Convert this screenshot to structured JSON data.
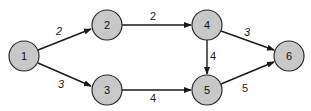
{
  "graph": {
    "type": "directed-weighted",
    "nodes": [
      {
        "id": "1",
        "label": "1",
        "x": 24,
        "y": 56
      },
      {
        "id": "2",
        "label": "2",
        "x": 107,
        "y": 25
      },
      {
        "id": "3",
        "label": "3",
        "x": 107,
        "y": 90
      },
      {
        "id": "4",
        "label": "4",
        "x": 207,
        "y": 25
      },
      {
        "id": "5",
        "label": "5",
        "x": 207,
        "y": 90
      },
      {
        "id": "6",
        "label": "6",
        "x": 289,
        "y": 56
      }
    ],
    "edges": [
      {
        "from": "1",
        "to": "2",
        "weight": "2"
      },
      {
        "from": "1",
        "to": "3",
        "weight": "3"
      },
      {
        "from": "2",
        "to": "4",
        "weight": "2"
      },
      {
        "from": "3",
        "to": "5",
        "weight": "4"
      },
      {
        "from": "4",
        "to": "5",
        "weight": "4"
      },
      {
        "from": "4",
        "to": "6",
        "weight": "3"
      },
      {
        "from": "5",
        "to": "6",
        "weight": "5"
      }
    ],
    "colors": {
      "node_fill": "#c8c8c8",
      "stroke": "#1a1a1a",
      "background": "#ffffff"
    }
  }
}
